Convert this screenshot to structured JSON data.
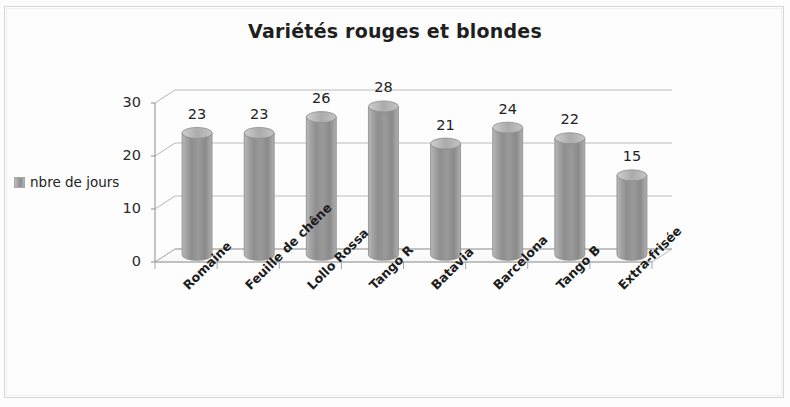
{
  "chart": {
    "title": "Variétés rouges et blondes",
    "legend": {
      "position": "left",
      "entries": [
        {
          "label": "nbre de jours",
          "color": "#9c9c9c",
          "marker": "legend-swatch"
        }
      ]
    }
  },
  "chart_data": {
    "type": "bar",
    "style": "3d-cylinder",
    "title": "Variétés rouges et blondes",
    "xlabel": "",
    "ylabel": "",
    "ylim": [
      0,
      30
    ],
    "yticks": [
      0,
      10,
      20,
      30
    ],
    "grid": true,
    "legend_position": "left",
    "categories": [
      "Romaine",
      "Feuille de chêne",
      "Lollo Rossa",
      "Tango R",
      "Batavia",
      "Barcelona",
      "Tango B",
      "Extra-frisée"
    ],
    "series": [
      {
        "name": "nbre de jours",
        "color": "#9c9c9c",
        "values": [
          23,
          23,
          26,
          28,
          21,
          24,
          22,
          15
        ]
      }
    ],
    "data_labels": [
      "23",
      "23",
      "26",
      "28",
      "21",
      "24",
      "22",
      "15"
    ]
  }
}
